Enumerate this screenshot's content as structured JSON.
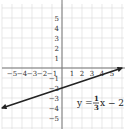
{
  "chart_data": {
    "type": "line",
    "title": "",
    "xlabel": "",
    "ylabel": "",
    "xlim": [
      -6,
      6
    ],
    "ylim": [
      -6,
      6
    ],
    "grid": true,
    "x_tick_labels": [
      "−5",
      "−4",
      "−3",
      "−2",
      "−1",
      "1",
      "2",
      "3",
      "4",
      "5"
    ],
    "y_tick_labels": [
      "5",
      "4",
      "3",
      "2",
      "1",
      "−1",
      "−2",
      "−3",
      "−4",
      "−5"
    ],
    "series": [
      {
        "name": "y = (1/3)x − 2",
        "slope": 0.3333,
        "intercept": -2,
        "x": [
          -6,
          -3,
          0,
          3,
          6
        ],
        "y": [
          -4,
          -3,
          -2,
          -1,
          0
        ],
        "arrows": "both",
        "color": "#222222"
      }
    ],
    "annotations": [
      {
        "text": "y = 1/3 x − 2",
        "x": 3.5,
        "y": -3.5
      }
    ]
  },
  "equation": {
    "lhs": "y =",
    "numerator": "1",
    "denominator": "3",
    "rhs": "x − 2"
  },
  "colors": {
    "grid": "#d9d9d9",
    "axis": "#777777",
    "line": "#222222"
  }
}
